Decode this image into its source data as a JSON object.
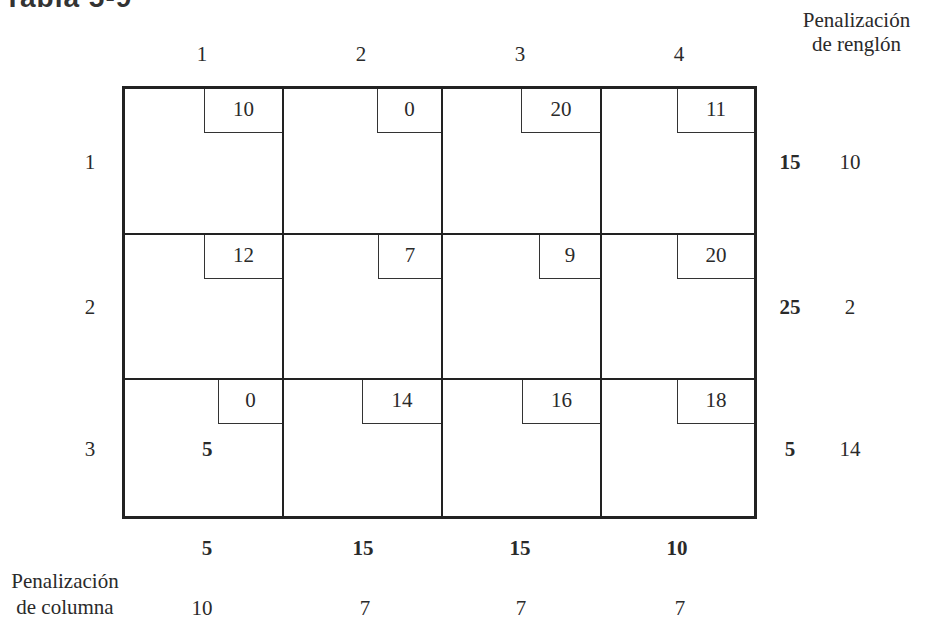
{
  "title": "Tabla 5-9",
  "row_penalty_header": [
    "Penalización",
    "de renglón"
  ],
  "column_penalty_header": [
    "Penalización",
    "de columna"
  ],
  "column_labels": [
    "1",
    "2",
    "3",
    "4"
  ],
  "row_labels": [
    "1",
    "2",
    "3"
  ],
  "costs": [
    [
      "10",
      "0",
      "20",
      "11"
    ],
    [
      "12",
      "7",
      "9",
      "20"
    ],
    [
      "0",
      "14",
      "16",
      "18"
    ]
  ],
  "allocations": [
    [
      "",
      "",
      "",
      ""
    ],
    [
      "",
      "",
      "",
      ""
    ],
    [
      "5",
      "",
      "",
      ""
    ]
  ],
  "supply": [
    "15",
    "25",
    "5"
  ],
  "row_penalties": [
    "10",
    "2",
    "14"
  ],
  "demand": [
    "5",
    "15",
    "15",
    "10"
  ],
  "column_penalties": [
    "10",
    "7",
    "7",
    "7"
  ]
}
